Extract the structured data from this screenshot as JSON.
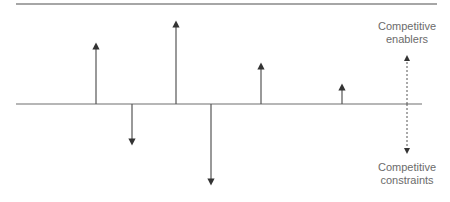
{
  "diagram": {
    "top_line": {
      "x1": 16,
      "x2": 437,
      "y": 4
    },
    "baseline": {
      "x1": 16,
      "x2": 422,
      "y": 104
    },
    "arrows": [
      {
        "x": 96,
        "direction": "up",
        "tip_y": 43
      },
      {
        "x": 132,
        "direction": "down",
        "tip_y": 145
      },
      {
        "x": 176,
        "direction": "up",
        "tip_y": 21
      },
      {
        "x": 211,
        "direction": "down",
        "tip_y": 185
      },
      {
        "x": 261,
        "direction": "up",
        "tip_y": 63
      },
      {
        "x": 342,
        "direction": "up",
        "tip_y": 84
      }
    ],
    "scale_arrow": {
      "x": 407,
      "top_y": 55,
      "bottom_y": 154,
      "style": "dashed"
    },
    "labels": {
      "enablers_line1": "Competitive",
      "enablers_line2": "enablers",
      "constraints_line1": "Competitive",
      "constraints_line2": "constraints"
    },
    "colors": {
      "line": "#7a7a7a",
      "arrow": "#333333",
      "text": "#6b6b6b"
    }
  }
}
